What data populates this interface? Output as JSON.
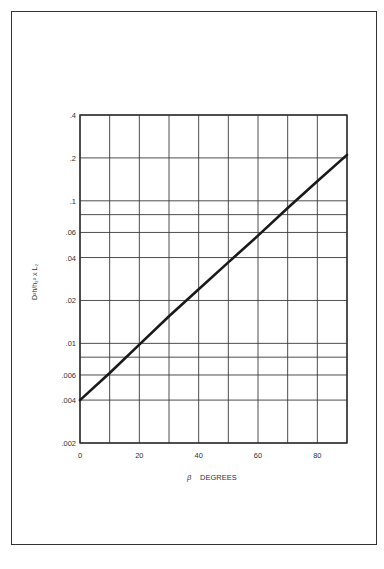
{
  "chart_data": {
    "type": "line",
    "title": "",
    "xlabel": "β  DEGREES",
    "ylabel": "D²h/h₂² x L₂",
    "x_axis": {
      "scale": "linear",
      "range": [
        0,
        90
      ],
      "ticks": [
        0,
        20,
        40,
        60,
        80
      ],
      "tick_labels": [
        "0",
        "20",
        "40",
        "60",
        "80"
      ],
      "gridlines": [
        0,
        10,
        20,
        30,
        40,
        50,
        60,
        70,
        80,
        90
      ]
    },
    "y_axis": {
      "scale": "log",
      "range": [
        0.002,
        0.4
      ],
      "ticks": [
        0.4,
        0.2,
        0.1,
        0.06,
        0.04,
        0.02,
        0.01,
        0.006,
        0.004,
        0.002
      ],
      "tick_labels": [
        ".4",
        ".2",
        ".1",
        ".06",
        ".04",
        ".02",
        ".01",
        ".006",
        ".004",
        ".002"
      ],
      "gridlines": [
        0.4,
        0.2,
        0.1,
        0.08,
        0.06,
        0.04,
        0.02,
        0.01,
        0.008,
        0.006,
        0.004,
        0.002
      ]
    },
    "grid": true,
    "legend": null,
    "series": [
      {
        "name": "curve",
        "x": [
          0,
          10,
          20,
          30,
          40,
          50,
          60,
          70,
          80,
          90
        ],
        "y": [
          0.004,
          0.0062,
          0.0098,
          0.0155,
          0.024,
          0.037,
          0.057,
          0.089,
          0.137,
          0.21
        ]
      }
    ]
  },
  "labels": {
    "xlabel_symbol": "β",
    "xlabel_text": "DEGREES",
    "ylabel": "D²h/h₂² x L₂"
  }
}
